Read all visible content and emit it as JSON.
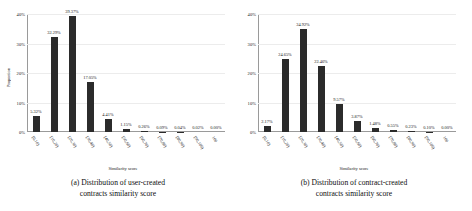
{
  "figure": {
    "ylabel": "Proportion",
    "xlabel": "Similarity score",
    "yticks": [
      "0%",
      "10%",
      "20%",
      "30%",
      "40%"
    ],
    "categories": [
      "[0,10)",
      "[10,20)",
      "[20,30)",
      "[30,40)",
      "[40,50)",
      "[50,60)",
      "[60,70)",
      "[70,80)",
      "[80,90)",
      "[90,100)",
      "100"
    ],
    "bar_color": "#2b2b2b",
    "axis_color": "#9a9a9a"
  },
  "panels": [
    {
      "id": "panel-a",
      "caption_line1": "(a) Distribution of user-created",
      "caption_line2": "contracts similarity score",
      "labels": [
        "5.32%",
        "32.29%",
        "39.37%",
        "17.05%",
        "4.41%",
        "1.15%",
        "0.26%",
        "0.09%",
        "0.04%",
        "0.02%",
        "0.00%"
      ]
    },
    {
      "id": "panel-b",
      "caption_line1": "(b) Distribution of contract-created",
      "caption_line2": "contracts similarity score",
      "labels": [
        "2.17%",
        "24.65%",
        "34.92%",
        "22.46%",
        "9.57%",
        "3.87%",
        "1.48%",
        "0.55%",
        "0.23%",
        "0.10%",
        "0.00%"
      ]
    }
  ],
  "chart_data": [
    {
      "type": "bar",
      "title": "(a) Distribution of user-created contracts similarity score",
      "xlabel": "Similarity score",
      "ylabel": "Proportion",
      "categories": [
        "[0,10)",
        "[10,20)",
        "[20,30)",
        "[30,40)",
        "[40,50)",
        "[50,60)",
        "[60,70)",
        "[70,80)",
        "[80,90)",
        "[90,100)",
        "100"
      ],
      "values": [
        5.32,
        32.29,
        39.37,
        17.05,
        4.41,
        1.15,
        0.26,
        0.09,
        0.04,
        0.02,
        0.0
      ],
      "value_labels": [
        "5.32%",
        "32.29%",
        "39.37%",
        "17.05%",
        "4.41%",
        "1.15%",
        "0.26%",
        "0.09%",
        "0.04%",
        "0.02%",
        "0.00%"
      ],
      "ylim": [
        0,
        40
      ],
      "yticks": [
        0,
        10,
        20,
        30,
        40
      ],
      "ytick_labels": [
        "0%",
        "10%",
        "20%",
        "30%",
        "40%"
      ],
      "grid": true,
      "legend": "none",
      "series_color": "#2b2b2b"
    },
    {
      "type": "bar",
      "title": "(b) Distribution of contract-created contracts similarity score",
      "xlabel": "Similarity score",
      "ylabel": "Proportion",
      "categories": [
        "[0,10)",
        "[10,20)",
        "[20,30)",
        "[30,40)",
        "[40,50)",
        "[50,60)",
        "[60,70)",
        "[70,80)",
        "[80,90)",
        "[90,100)",
        "100"
      ],
      "values": [
        2.17,
        24.65,
        34.92,
        22.46,
        9.57,
        3.87,
        1.48,
        0.55,
        0.23,
        0.1,
        0.0
      ],
      "value_labels": [
        "2.17%",
        "24.65%",
        "34.92%",
        "22.46%",
        "9.57%",
        "3.87%",
        "1.48%",
        "0.55%",
        "0.23%",
        "0.10%",
        "0.00%"
      ],
      "ylim": [
        0,
        40
      ],
      "yticks": [
        0,
        10,
        20,
        30,
        40
      ],
      "ytick_labels": [
        "0%",
        "10%",
        "20%",
        "30%",
        "40%"
      ],
      "grid": true,
      "legend": "none",
      "series_color": "#2b2b2b"
    }
  ]
}
